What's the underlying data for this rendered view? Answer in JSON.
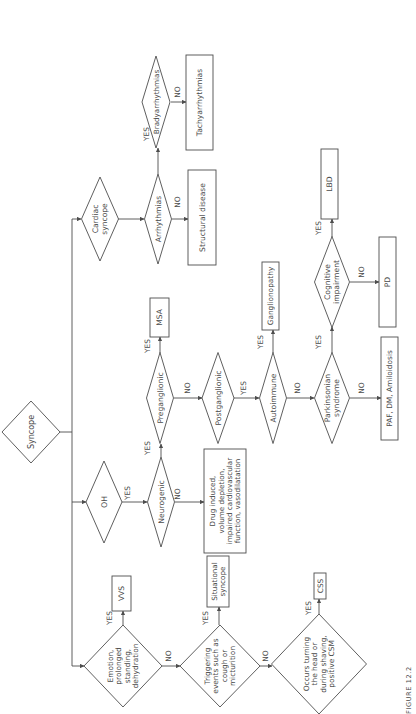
{
  "figure": {
    "caption": "FIGURE 12.2",
    "orientation": "rotated -90deg",
    "stroke_color": "#4d4d4d",
    "text_color": "#4a4a4a"
  },
  "nodes": [
    {
      "id": "syncope",
      "type": "decision",
      "lines": [
        "Syncope"
      ],
      "cx": 31,
      "cy": 432,
      "w": 58,
      "h": 62,
      "fs": 8
    },
    {
      "id": "cardiac",
      "type": "decision",
      "lines": [
        "Cardiac",
        "syncope"
      ],
      "cx": 100,
      "cy": 219,
      "w": 37,
      "h": 84,
      "fs": 7.6
    },
    {
      "id": "arrhythmias",
      "type": "decision",
      "lines": [
        "Arrhythmias"
      ],
      "cx": 158,
      "cy": 219,
      "w": 27,
      "h": 90,
      "fs": 7.6
    },
    {
      "id": "bradyarrhythmias",
      "type": "decision",
      "lines": [
        "Bradyarrhythmias"
      ],
      "cx": 156,
      "cy": 102,
      "w": 28,
      "h": 92,
      "fs": 7.2
    },
    {
      "id": "structural",
      "type": "result",
      "lines": [
        "Structural disease"
      ],
      "x": 188,
      "y": 170,
      "w": 28,
      "h": 95,
      "fs": 7.6
    },
    {
      "id": "tachyarrhythmias",
      "type": "result",
      "lines": [
        "Tachyarrhythmias"
      ],
      "x": 186,
      "y": 55,
      "w": 27,
      "h": 95,
      "fs": 7.6
    },
    {
      "id": "oh",
      "type": "decision",
      "lines": [
        "OH"
      ],
      "cx": 104,
      "cy": 502,
      "w": 36,
      "h": 82,
      "fs": 7.8
    },
    {
      "id": "neurogenic",
      "type": "decision",
      "lines": [
        "Neurogenic"
      ],
      "cx": 161,
      "cy": 502,
      "w": 27,
      "h": 90,
      "fs": 7.6
    },
    {
      "id": "drug",
      "type": "result",
      "lines": [
        "Drug induced,",
        "volume depletion,",
        "impaired cardiovascular",
        "function, vasodilatation"
      ],
      "x": 204,
      "y": 449,
      "w": 42,
      "h": 104,
      "fs": 7.2
    },
    {
      "id": "preganglionic",
      "type": "decision",
      "lines": [
        "Preganglionic"
      ],
      "cx": 160,
      "cy": 398,
      "w": 27,
      "h": 91,
      "fs": 7.6
    },
    {
      "id": "msa",
      "type": "result",
      "lines": [
        "MSA"
      ],
      "x": 150,
      "y": 298,
      "w": 19,
      "h": 39,
      "fs": 7.6
    },
    {
      "id": "postganglionic",
      "type": "decision",
      "lines": [
        "Postganglionic"
      ],
      "cx": 218,
      "cy": 398,
      "w": 32,
      "h": 91,
      "fs": 7.6
    },
    {
      "id": "autoimmune",
      "type": "decision",
      "lines": [
        "Autoimmune"
      ],
      "cx": 273,
      "cy": 398,
      "w": 27,
      "h": 91,
      "fs": 7.6
    },
    {
      "id": "ganglionopathy",
      "type": "result",
      "lines": [
        "Ganglionopathy"
      ],
      "x": 262,
      "y": 262,
      "w": 17,
      "h": 68,
      "fs": 7.4
    },
    {
      "id": "parkinsonian",
      "type": "decision",
      "lines": [
        "Parkinsonian",
        "syndrome"
      ],
      "cx": 332,
      "cy": 398,
      "w": 35,
      "h": 91,
      "fs": 7.6
    },
    {
      "id": "cognitive",
      "type": "decision",
      "lines": [
        "Cognitive",
        "impairment"
      ],
      "cx": 332,
      "cy": 282,
      "w": 35,
      "h": 91,
      "fs": 7.6
    },
    {
      "id": "lbd",
      "type": "result",
      "lines": [
        "LBD"
      ],
      "x": 321,
      "y": 149,
      "w": 17,
      "h": 70,
      "fs": 7.6
    },
    {
      "id": "pd",
      "type": "result",
      "lines": [
        "PD"
      ],
      "x": 379,
      "y": 237,
      "w": 17,
      "h": 90,
      "fs": 7.6
    },
    {
      "id": "paf",
      "type": "result",
      "lines": [
        "PAF, DM, Amiloidosis"
      ],
      "x": 381,
      "y": 337,
      "w": 17,
      "h": 103,
      "fs": 7.4
    },
    {
      "id": "emotion",
      "type": "decision",
      "lines": [
        "Emotion,",
        "prolonged",
        "standing,",
        "dehydration"
      ],
      "cx": 123,
      "cy": 666,
      "w": 78,
      "h": 82,
      "fs": 7.4
    },
    {
      "id": "vvs",
      "type": "result",
      "lines": [
        "VVS"
      ],
      "x": 112,
      "y": 576,
      "w": 19,
      "h": 35,
      "fs": 7.6
    },
    {
      "id": "triggering",
      "type": "decision",
      "lines": [
        "Triggering",
        "events such as",
        "cough or",
        "micturition"
      ],
      "cx": 220,
      "cy": 666,
      "w": 80,
      "h": 82,
      "fs": 7.4
    },
    {
      "id": "situational",
      "type": "result",
      "lines": [
        "Situational",
        "syncope"
      ],
      "x": 207,
      "y": 556,
      "w": 22,
      "h": 51,
      "fs": 7.2
    },
    {
      "id": "occurs",
      "type": "decision",
      "lines": [
        "Occurs turning",
        "the head or",
        "during shaving,",
        "positive CSM"
      ],
      "cx": 319,
      "cy": 664,
      "w": 95,
      "h": 100,
      "fs": 7.4
    },
    {
      "id": "css",
      "type": "result",
      "lines": [
        "CSS"
      ],
      "x": 314,
      "y": 573,
      "w": 12,
      "h": 26,
      "fs": 7.4
    }
  ],
  "edge_labels": [
    {
      "text": "YES",
      "x": 149,
      "y": 134
    },
    {
      "text": "NO",
      "x": 180,
      "y": 92
    },
    {
      "text": "NO",
      "x": 180,
      "y": 202
    },
    {
      "text": "YES",
      "x": 130,
      "y": 493
    },
    {
      "text": "YES",
      "x": 150,
      "y": 448
    },
    {
      "text": "NO",
      "x": 180,
      "y": 494
    },
    {
      "text": "YES",
      "x": 150,
      "y": 346
    },
    {
      "text": "NO",
      "x": 190,
      "y": 388
    },
    {
      "text": "YES",
      "x": 246,
      "y": 388
    },
    {
      "text": "YES",
      "x": 263,
      "y": 342
    },
    {
      "text": "NO",
      "x": 300,
      "y": 388
    },
    {
      "text": "YES",
      "x": 321,
      "y": 342
    },
    {
      "text": "NO",
      "x": 364,
      "y": 388
    },
    {
      "text": "YES",
      "x": 321,
      "y": 228
    },
    {
      "text": "NO",
      "x": 364,
      "y": 272
    },
    {
      "text": "YES",
      "x": 112,
      "y": 618
    },
    {
      "text": "NO",
      "x": 171,
      "y": 656
    },
    {
      "text": "YES",
      "x": 208,
      "y": 618
    },
    {
      "text": "NO",
      "x": 268,
      "y": 656
    },
    {
      "text": "YES",
      "x": 311,
      "y": 608
    }
  ]
}
